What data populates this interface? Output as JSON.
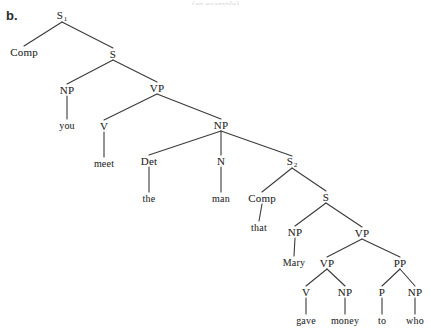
{
  "figure": {
    "item_label": "b.",
    "bleed_text": "(an example)",
    "background_color": "#ffffff",
    "line_color": "#3a3a3a",
    "text_color": "#2f2f2f",
    "width": 431,
    "height": 334
  },
  "tree": {
    "description": "Phrase structure tree for the sentence: Comp you meet the man that Mary gave money to who",
    "sentence": "you meet the man that Mary gave money to who",
    "nodes": [
      {
        "id": "n0",
        "label": "S",
        "subscript": "1",
        "x": 62,
        "y": 16,
        "kind": "nonterminal"
      },
      {
        "id": "n1",
        "label": "Comp",
        "subscript": "",
        "x": 24,
        "y": 52,
        "kind": "nonterminal"
      },
      {
        "id": "n2",
        "label": "S",
        "subscript": "",
        "x": 113,
        "y": 54,
        "kind": "nonterminal"
      },
      {
        "id": "n3",
        "label": "NP",
        "subscript": "",
        "x": 67,
        "y": 90,
        "kind": "nonterminal"
      },
      {
        "id": "n4",
        "label": "you",
        "subscript": "",
        "x": 67,
        "y": 125,
        "kind": "terminal"
      },
      {
        "id": "n5",
        "label": "VP",
        "subscript": "",
        "x": 157,
        "y": 88,
        "kind": "nonterminal"
      },
      {
        "id": "n6",
        "label": "V",
        "subscript": "",
        "x": 104,
        "y": 126,
        "kind": "nonterminal"
      },
      {
        "id": "n7",
        "label": "meet",
        "subscript": "",
        "x": 104,
        "y": 163,
        "kind": "terminal"
      },
      {
        "id": "n8",
        "label": "NP",
        "subscript": "",
        "x": 221,
        "y": 125,
        "kind": "nonterminal"
      },
      {
        "id": "n9",
        "label": "Det",
        "subscript": "",
        "x": 149,
        "y": 161,
        "kind": "nonterminal"
      },
      {
        "id": "n10",
        "label": "the",
        "subscript": "",
        "x": 149,
        "y": 198,
        "kind": "terminal"
      },
      {
        "id": "n11",
        "label": "N",
        "subscript": "",
        "x": 221,
        "y": 161,
        "kind": "nonterminal"
      },
      {
        "id": "n12",
        "label": "man",
        "subscript": "",
        "x": 221,
        "y": 198,
        "kind": "terminal"
      },
      {
        "id": "n13",
        "label": "S",
        "subscript": "2",
        "x": 292,
        "y": 162,
        "kind": "nonterminal"
      },
      {
        "id": "n14",
        "label": "Comp",
        "subscript": "",
        "x": 262,
        "y": 198,
        "kind": "nonterminal"
      },
      {
        "id": "n15",
        "label": "that",
        "subscript": "",
        "x": 259,
        "y": 227,
        "kind": "terminal"
      },
      {
        "id": "n16",
        "label": "S",
        "subscript": "",
        "x": 326,
        "y": 197,
        "kind": "nonterminal"
      },
      {
        "id": "n17",
        "label": "NP",
        "subscript": "",
        "x": 295,
        "y": 232,
        "kind": "nonterminal"
      },
      {
        "id": "n18",
        "label": "Mary",
        "subscript": "",
        "x": 294,
        "y": 262,
        "kind": "terminal"
      },
      {
        "id": "n19",
        "label": "VP",
        "subscript": "",
        "x": 362,
        "y": 233,
        "kind": "nonterminal"
      },
      {
        "id": "n20",
        "label": "VP",
        "subscript": "",
        "x": 327,
        "y": 263,
        "kind": "nonterminal"
      },
      {
        "id": "n21",
        "label": "V",
        "subscript": "",
        "x": 306,
        "y": 292,
        "kind": "nonterminal"
      },
      {
        "id": "n22",
        "label": "gave",
        "subscript": "",
        "x": 306,
        "y": 320,
        "kind": "terminal"
      },
      {
        "id": "n23",
        "label": "NP",
        "subscript": "",
        "x": 345,
        "y": 292,
        "kind": "nonterminal"
      },
      {
        "id": "n24",
        "label": "money",
        "subscript": "",
        "x": 345,
        "y": 320,
        "kind": "terminal"
      },
      {
        "id": "n25",
        "label": "PP",
        "subscript": "",
        "x": 400,
        "y": 263,
        "kind": "nonterminal"
      },
      {
        "id": "n26",
        "label": "P",
        "subscript": "",
        "x": 382,
        "y": 292,
        "kind": "nonterminal"
      },
      {
        "id": "n27",
        "label": "to",
        "subscript": "",
        "x": 382,
        "y": 320,
        "kind": "terminal"
      },
      {
        "id": "n28",
        "label": "NP",
        "subscript": "",
        "x": 415,
        "y": 292,
        "kind": "nonterminal"
      },
      {
        "id": "n29",
        "label": "who",
        "subscript": "",
        "x": 415,
        "y": 320,
        "kind": "terminal"
      }
    ],
    "edges": [
      {
        "from": "n0",
        "to": "n1"
      },
      {
        "from": "n0",
        "to": "n2"
      },
      {
        "from": "n2",
        "to": "n3"
      },
      {
        "from": "n2",
        "to": "n5"
      },
      {
        "from": "n3",
        "to": "n4"
      },
      {
        "from": "n5",
        "to": "n6"
      },
      {
        "from": "n5",
        "to": "n8"
      },
      {
        "from": "n6",
        "to": "n7"
      },
      {
        "from": "n8",
        "to": "n9"
      },
      {
        "from": "n8",
        "to": "n11"
      },
      {
        "from": "n8",
        "to": "n13"
      },
      {
        "from": "n9",
        "to": "n10"
      },
      {
        "from": "n11",
        "to": "n12"
      },
      {
        "from": "n13",
        "to": "n14"
      },
      {
        "from": "n13",
        "to": "n16"
      },
      {
        "from": "n14",
        "to": "n15"
      },
      {
        "from": "n16",
        "to": "n17"
      },
      {
        "from": "n16",
        "to": "n19"
      },
      {
        "from": "n17",
        "to": "n18"
      },
      {
        "from": "n19",
        "to": "n20"
      },
      {
        "from": "n19",
        "to": "n25"
      },
      {
        "from": "n20",
        "to": "n21"
      },
      {
        "from": "n20",
        "to": "n23"
      },
      {
        "from": "n21",
        "to": "n22"
      },
      {
        "from": "n23",
        "to": "n24"
      },
      {
        "from": "n25",
        "to": "n26"
      },
      {
        "from": "n25",
        "to": "n28"
      },
      {
        "from": "n26",
        "to": "n27"
      },
      {
        "from": "n28",
        "to": "n29"
      }
    ]
  }
}
